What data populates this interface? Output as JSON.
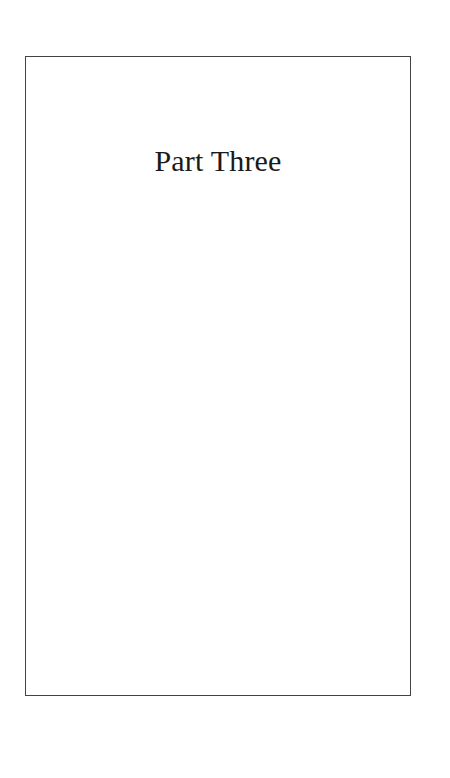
{
  "page": {
    "title": "Part Three",
    "frame_color": "#444444",
    "text_color": "#1a1a1a",
    "background": "#ffffff"
  }
}
